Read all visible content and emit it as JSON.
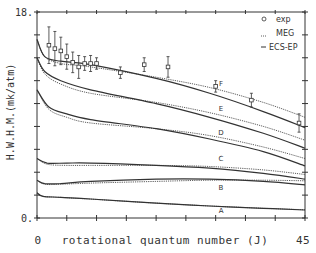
{
  "chart_data": {
    "type": "line",
    "title": "",
    "xlabel": "rotational quantum number (J)",
    "ylabel": "H.W.H.M.(mk/atm)",
    "xlim": [
      0,
      45
    ],
    "ylim": [
      0,
      18
    ],
    "x_tick_labels": [
      {
        "value": 0,
        "label": "0"
      },
      {
        "value": 45,
        "label": "45"
      }
    ],
    "y_tick_labels": [
      {
        "value": 0,
        "label": "0."
      },
      {
        "value": 18,
        "label": "18."
      }
    ],
    "x_ticks": [
      0,
      5,
      10,
      15,
      20,
      25,
      30,
      35,
      40,
      45
    ],
    "y_ticks": [
      0,
      2,
      4,
      6,
      8,
      10,
      12,
      14,
      16,
      18
    ],
    "grid": false,
    "legend": {
      "position": "upper right",
      "entries": [
        {
          "marker": "o",
          "label": "exp"
        },
        {
          "marker": "dashed",
          "label": "MEG"
        },
        {
          "marker": "solid",
          "label": "ECS-EP"
        }
      ]
    },
    "experimental": {
      "name": "exp",
      "points": [
        {
          "x": 2,
          "y": 15.1,
          "err": 1.6
        },
        {
          "x": 3,
          "y": 14.8,
          "err": 1.5
        },
        {
          "x": 4,
          "y": 14.6,
          "err": 1.2
        },
        {
          "x": 5,
          "y": 14.1,
          "err": 1.1
        },
        {
          "x": 6,
          "y": 13.6,
          "err": 0.9
        },
        {
          "x": 7,
          "y": 13.2,
          "err": 1.0
        },
        {
          "x": 8,
          "y": 13.5,
          "err": 0.6
        },
        {
          "x": 9,
          "y": 13.5,
          "err": 0.7
        },
        {
          "x": 10,
          "y": 13.5,
          "err": 0.5
        },
        {
          "x": 14,
          "y": 12.7,
          "err": 0.5
        },
        {
          "x": 18,
          "y": 13.4,
          "err": 0.6
        },
        {
          "x": 22,
          "y": 13.2,
          "err": 0.9
        },
        {
          "x": 30,
          "y": 11.5,
          "err": 0.5
        },
        {
          "x": 36,
          "y": 10.3,
          "err": 0.6
        },
        {
          "x": 44,
          "y": 8.3,
          "err": 0.8
        }
      ]
    },
    "series": [
      {
        "name": "F",
        "model": "ECS-EP",
        "style": "solid",
        "x": [
          0,
          1.3,
          4,
          9,
          20,
          29,
          38,
          45
        ],
        "values": [
          15.6,
          14.1,
          13.7,
          13.4,
          12.2,
          10.9,
          9.3,
          7.9
        ]
      },
      {
        "name": "F",
        "model": "MEG",
        "style": "dashed",
        "x": [
          0,
          1.3,
          4,
          9,
          20,
          29,
          38,
          45
        ],
        "values": [
          15.6,
          14.1,
          13.5,
          13.2,
          12.3,
          11.4,
          10.1,
          8.8
        ]
      },
      {
        "name": "E",
        "model": "ECS-EP",
        "style": "solid",
        "x": [
          0,
          1.3,
          4,
          9,
          20,
          29,
          38,
          45
        ],
        "values": [
          14.0,
          12.8,
          12.0,
          11.2,
          10.0,
          8.8,
          7.4,
          6.1
        ]
      },
      {
        "name": "E",
        "model": "MEG",
        "style": "dashed",
        "x": [
          0,
          1.3,
          4,
          9,
          20,
          29,
          38,
          45
        ],
        "values": [
          14.0,
          12.6,
          11.7,
          10.9,
          10.1,
          9.2,
          8.0,
          6.8
        ]
      },
      {
        "name": "D",
        "model": "ECS-EP",
        "style": "solid",
        "x": [
          0,
          2,
          5,
          9,
          20,
          29,
          38,
          45
        ],
        "values": [
          11.2,
          9.7,
          9.1,
          8.6,
          7.8,
          6.9,
          5.8,
          4.55
        ]
      },
      {
        "name": "D",
        "model": "MEG",
        "style": "dashed",
        "x": [
          0,
          2,
          5,
          9,
          20,
          29,
          38,
          45
        ],
        "values": [
          11.2,
          9.5,
          8.8,
          8.3,
          7.8,
          7.2,
          6.2,
          5.2
        ]
      },
      {
        "name": "C",
        "model": "ECS-EP",
        "style": "solid",
        "x": [
          0,
          1.7,
          5,
          9,
          20,
          29,
          38,
          45
        ],
        "values": [
          5.2,
          4.8,
          4.8,
          4.8,
          4.6,
          4.35,
          3.9,
          3.4
        ]
      },
      {
        "name": "C",
        "model": "MEG",
        "style": "dashed",
        "x": [
          0,
          1.7,
          5,
          9,
          20,
          29,
          38,
          45
        ],
        "values": [
          5.2,
          4.7,
          4.6,
          4.6,
          4.6,
          4.5,
          4.2,
          3.8
        ]
      },
      {
        "name": "B",
        "model": "ECS-EP",
        "style": "solid",
        "x": [
          0,
          1.3,
          4,
          9,
          20,
          29,
          38,
          45
        ],
        "values": [
          3.3,
          3.0,
          3.0,
          3.2,
          3.4,
          3.4,
          3.2,
          2.9
        ]
      },
      {
        "name": "B",
        "model": "MEG",
        "style": "dashed",
        "x": [
          0,
          1.3,
          4,
          9,
          20,
          29,
          38,
          45
        ],
        "values": [
          3.3,
          2.95,
          2.95,
          3.05,
          3.2,
          3.3,
          3.3,
          3.25
        ]
      },
      {
        "name": "A",
        "model": "ECS-EP",
        "style": "solid",
        "x": [
          0,
          1,
          4,
          9,
          20,
          29,
          38,
          45
        ],
        "values": [
          2.2,
          1.9,
          1.8,
          1.66,
          1.3,
          1.05,
          0.85,
          0.7
        ]
      },
      {
        "name": "A",
        "model": "MEG",
        "style": "dashed",
        "x": [
          0,
          1,
          4,
          9,
          20,
          29,
          38,
          45
        ],
        "values": [
          2.2,
          1.9,
          1.8,
          1.65,
          1.3,
          1.05,
          0.85,
          0.72
        ]
      }
    ],
    "curve_labels": [
      {
        "label": "F",
        "x": 30.9,
        "y": 11.5
      },
      {
        "label": "E",
        "x": 30.9,
        "y": 9.35
      },
      {
        "label": "D",
        "x": 30.9,
        "y": 7.25
      },
      {
        "label": "C",
        "x": 30.9,
        "y": 4.95
      },
      {
        "label": "B",
        "x": 30.9,
        "y": 2.45
      },
      {
        "label": "A",
        "x": 30.9,
        "y": 0.45
      }
    ]
  },
  "colors": {
    "ink": "#333333",
    "background": "#ffffff"
  }
}
